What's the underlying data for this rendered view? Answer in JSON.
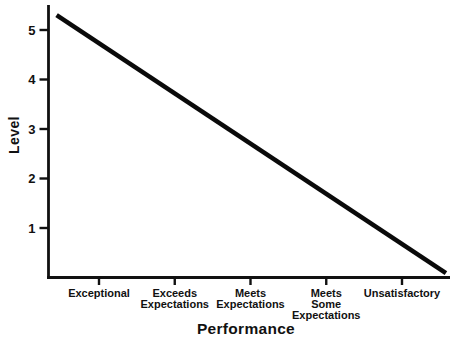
{
  "figure": {
    "background": "#ffffff",
    "ink_color": "#111111"
  },
  "chart_data": {
    "type": "line",
    "xlabel": "Performance",
    "ylabel": "Level",
    "categories": [
      "Exceptional",
      "Exceeds Expectations",
      "Meets Expectations",
      "Meets Some Expectations",
      "Unsatisfactory"
    ],
    "values": [
      4.8,
      3.8,
      2.8,
      1.8,
      0.8
    ],
    "yticks": [
      1,
      2,
      3,
      4,
      5
    ],
    "ylim": [
      0,
      5.5
    ],
    "grid": false,
    "legend": false,
    "trend_line": {
      "description": "single straight thick black line declining left-to-right, starting left of the Exceptional tick and ending just above the x-axis right of the Unsatisfactory tick",
      "start": {
        "x_index": -0.56,
        "level": 5.3
      },
      "end": {
        "x_index": 4.58,
        "level": 0.09
      },
      "color": "#0a0a0a",
      "width_px": 4.6
    }
  }
}
